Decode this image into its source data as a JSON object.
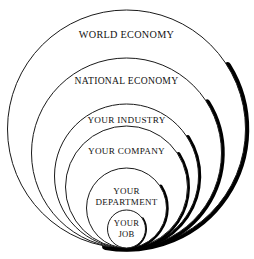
{
  "diagram": {
    "type": "concentric-circles",
    "background_color": "#ffffff",
    "outline_color": "#1a1a1a",
    "shadow_color": "#000000",
    "text_color": "#111111",
    "rings": [
      {
        "id": "world-economy",
        "label": "WORLD ECONOMY",
        "lines": [
          "WORLD ECONOMY"
        ],
        "cx": 126.5,
        "cy": 129,
        "r": 119,
        "font_size": 10.2,
        "label_y": 36,
        "shadow_width": 7.5
      },
      {
        "id": "national-economy",
        "label": "NATIONAL ECONOMY",
        "lines": [
          "NATIONAL ECONOMY"
        ],
        "cx": 126.5,
        "cy": 153,
        "r": 95,
        "font_size": 9.6,
        "label_y": 82,
        "shadow_width": 6.5
      },
      {
        "id": "your-industry",
        "label": "YOUR INDUSTRY",
        "lines": [
          "YOUR INDUSTRY"
        ],
        "cx": 126.5,
        "cy": 176,
        "r": 72,
        "font_size": 9.2,
        "label_y": 121,
        "shadow_width": 5.5
      },
      {
        "id": "your-company",
        "label": "YOUR COMPANY",
        "lines": [
          "YOUR COMPANY"
        ],
        "cx": 126.5,
        "cy": 187,
        "r": 61,
        "font_size": 9.2,
        "label_y": 152,
        "shadow_width": 5.0
      },
      {
        "id": "your-department",
        "label": "YOUR DEPARTMENT",
        "lines": [
          "YOUR",
          "DEPARTMENT"
        ],
        "cx": 126.5,
        "cy": 208,
        "r": 40,
        "font_size": 9.0,
        "label_y": 192,
        "shadow_width": 4.5
      },
      {
        "id": "your-job",
        "label": "YOUR JOB",
        "lines": [
          "YOUR",
          "JOB"
        ],
        "cx": 126.5,
        "cy": 229,
        "r": 19,
        "font_size": 8.6,
        "label_y": 224,
        "shadow_width": 3.0
      }
    ]
  }
}
